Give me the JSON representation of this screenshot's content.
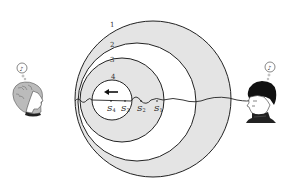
{
  "diagram": {
    "wavefronts": [
      {
        "label": "1",
        "cx": 153,
        "cy": 99,
        "r": 78
      },
      {
        "label": "2",
        "cx": 137,
        "cy": 102,
        "r": 59
      },
      {
        "label": "3",
        "cx": 122,
        "cy": 100,
        "r": 42
      },
      {
        "label": "4",
        "cx": 112,
        "cy": 100,
        "r": 20
      }
    ],
    "source_positions": [
      {
        "label": "S",
        "sub": "4",
        "x": 111,
        "y": 110
      },
      {
        "label": "S",
        "sub": "3",
        "x": 124,
        "y": 110
      },
      {
        "label": "S",
        "sub": "2",
        "x": 139,
        "y": 110
      },
      {
        "label": "S",
        "sub": "1",
        "x": 154,
        "y": 110
      }
    ],
    "motion_direction": "left",
    "observers": [
      {
        "id": "left-observer",
        "description": "woman with curly hair facing right",
        "thought_glyph": "♪"
      },
      {
        "id": "right-observer",
        "description": "man with dark hair facing left",
        "thought_glyph": "♪"
      }
    ],
    "colors": {
      "shade": "#e4e4e4",
      "line": "#222222",
      "background": "#ffffff"
    }
  }
}
